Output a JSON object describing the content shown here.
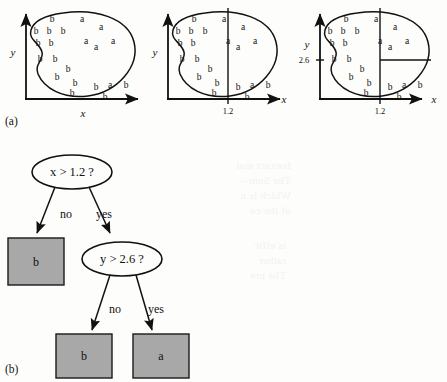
{
  "figure": {
    "panel_a_label": "(a)",
    "panel_b_label": "(b)",
    "class_a": "a",
    "class_b": "b"
  },
  "panels": [
    {
      "id": "panel-1",
      "xlabel": "x",
      "ylabel": "y",
      "xtick": "",
      "ytick": "",
      "split_x": false,
      "split_y": false
    },
    {
      "id": "panel-2",
      "xlabel": "x",
      "ylabel": "y",
      "xtick": "1.2",
      "ytick": "",
      "split_x": true,
      "split_y": false
    },
    {
      "id": "panel-3",
      "xlabel": "x",
      "ylabel": "y",
      "xtick": "1.2",
      "ytick": "2.6",
      "split_x": true,
      "split_y": true
    }
  ],
  "tree": {
    "root_label": "x > 1.2 ?",
    "child_label": "y > 2.6 ?",
    "edge_no_1": "no",
    "edge_yes_1": "yes",
    "edge_no_2": "no",
    "edge_yes_2": "yes",
    "leaf_1": "b",
    "leaf_2": "b",
    "leaf_3": "a"
  },
  "colors": {
    "ink": "#111111",
    "leaf_fill": "#a8a8a8",
    "leaf_stroke": "#1a1a1a",
    "page": "#fdfdfb"
  },
  "scatter": {
    "b_points": [
      [
        52,
        22
      ],
      [
        36,
        34
      ],
      [
        49,
        34
      ],
      [
        63,
        34
      ],
      [
        38,
        46
      ],
      [
        51,
        46
      ],
      [
        40,
        62
      ],
      [
        55,
        62
      ],
      [
        68,
        72
      ],
      [
        57,
        80
      ],
      [
        75,
        86
      ],
      [
        72,
        96
      ],
      [
        96,
        90
      ],
      [
        105,
        100
      ],
      [
        126,
        88
      ]
    ],
    "a_points": [
      [
        82,
        22
      ],
      [
        101,
        30
      ],
      [
        86,
        44
      ],
      [
        96,
        50
      ],
      [
        113,
        44
      ],
      [
        110,
        88
      ]
    ]
  },
  "bleed_text": {
    "block1": "Inexact mat\nThe Sum--\nWhich is n\nof the co",
    "block2": "is effic\nrather\nThe pre"
  }
}
